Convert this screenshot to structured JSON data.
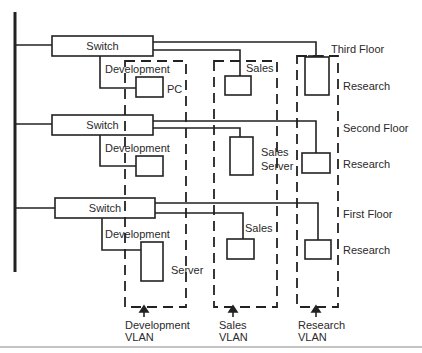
{
  "diagram": {
    "title": "",
    "colors": {
      "line": "#222222",
      "background": "#ffffff",
      "rule": "#888888"
    },
    "floors": [
      {
        "name": "Third Floor",
        "switch_label": "Switch",
        "devices": [
          {
            "vlan": "Development",
            "label": "PC"
          },
          {
            "vlan": "Sales",
            "label": "Sales"
          },
          {
            "vlan": "Research",
            "label": "Research"
          }
        ],
        "dev_label": "Development"
      },
      {
        "name": "Second Floor",
        "switch_label": "Switch",
        "devices": [
          {
            "vlan": "Development",
            "label": ""
          },
          {
            "vlan": "Sales",
            "label": "Sales Server"
          },
          {
            "vlan": "Research",
            "label": "Research"
          }
        ],
        "dev_label": "Development"
      },
      {
        "name": "First Floor",
        "switch_label": "Switch",
        "devices": [
          {
            "vlan": "Development",
            "label": "Server"
          },
          {
            "vlan": "Sales",
            "label": "Sales"
          },
          {
            "vlan": "Research",
            "label": "Research"
          }
        ],
        "dev_label": "Development"
      }
    ],
    "labels": {
      "third_floor": "Third Floor",
      "second_floor": "Second Floor",
      "first_floor": "First Floor",
      "switch": "Switch",
      "development": "Development",
      "pc": "PC",
      "sales": "Sales",
      "sales_server_1": "Sales",
      "sales_server_2": "Server",
      "server": "Server",
      "research": "Research"
    },
    "vlans": [
      {
        "name": "Development",
        "line1": "Development",
        "line2": "VLAN"
      },
      {
        "name": "Sales",
        "line1": "Sales",
        "line2": "VLAN"
      },
      {
        "name": "Research",
        "line1": "Research",
        "line2": "VLAN"
      }
    ]
  }
}
